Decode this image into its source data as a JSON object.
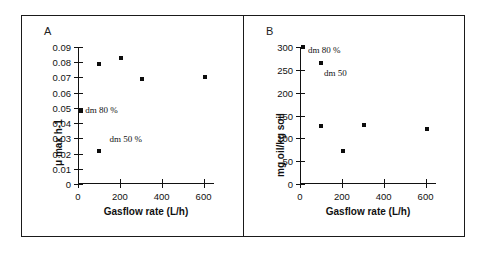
{
  "figure": {
    "panels": [
      {
        "letter": "A",
        "xlabel": "Gasflow rate (L/h)",
        "ylabel": "μ   max  h-1",
        "xticks": [
          0,
          200,
          400,
          600
        ],
        "xticklabels": [
          "0",
          "200",
          "400",
          "600"
        ],
        "yticks": [
          0,
          0.01,
          0.02,
          0.03,
          0.04,
          0.05,
          0.06,
          0.07,
          0.08,
          0.09
        ],
        "yticklabels": [
          "0",
          "0.01",
          "0.02",
          "0.03",
          "0.04",
          "0.05",
          "0.06",
          "0.07",
          "0.08",
          "0.09"
        ],
        "annotations": [
          {
            "text": "dm 80 %",
            "x": 35,
            "y": 0.0485
          },
          {
            "text": "dm 50 %",
            "x": 150,
            "y": 0.0295
          }
        ]
      },
      {
        "letter": "B",
        "xlabel": "Gasflow rate (L/h)",
        "ylabel": "mg  oil/kg  soil",
        "xticks": [
          0,
          200,
          400,
          600
        ],
        "xticklabels": [
          "0",
          "200",
          "400",
          "600"
        ],
        "yticks": [
          0,
          50,
          100,
          150,
          200,
          250,
          300
        ],
        "yticklabels": [
          "0",
          "50",
          "100",
          "150",
          "200",
          "250",
          "300"
        ],
        "annotations": [
          {
            "text": "dm 80 %",
            "x": 38,
            "y": 293
          },
          {
            "text": "dm 50",
            "x": 115,
            "y": 243
          }
        ]
      }
    ]
  },
  "chart_data": [
    {
      "type": "scatter",
      "title": "A",
      "xlabel": "Gasflow rate (L/h)",
      "ylabel": "μ max h-1",
      "xlim": [
        0,
        650
      ],
      "ylim": [
        0,
        0.09
      ],
      "xticks": [
        0,
        200,
        400,
        600
      ],
      "yticks": [
        0,
        0.01,
        0.02,
        0.03,
        0.04,
        0.05,
        0.06,
        0.07,
        0.08,
        0.09
      ],
      "grid": false,
      "legend": null,
      "series": [
        {
          "name": "dm 80 %",
          "points": [
            {
              "x": 12,
              "y": 0.048
            },
            {
              "x": 100,
              "y": 0.079
            },
            {
              "x": 205,
              "y": 0.083
            },
            {
              "x": 305,
              "y": 0.069
            },
            {
              "x": 605,
              "y": 0.07
            }
          ]
        },
        {
          "name": "dm 50 %",
          "points": [
            {
              "x": 102,
              "y": 0.022
            }
          ]
        }
      ],
      "annotations": [
        "dm 80 %",
        "dm 50 %"
      ]
    },
    {
      "type": "scatter",
      "title": "B",
      "xlabel": "Gasflow rate (L/h)",
      "ylabel": "mg oil/kg soil",
      "xlim": [
        0,
        650
      ],
      "ylim": [
        0,
        300
      ],
      "xticks": [
        0,
        200,
        400,
        600
      ],
      "yticks": [
        0,
        50,
        100,
        150,
        200,
        250,
        300
      ],
      "grid": false,
      "legend": null,
      "series": [
        {
          "name": "dm 80 %",
          "points": [
            {
              "x": 12,
              "y": 299
            },
            {
              "x": 100,
              "y": 264
            },
            {
              "x": 100,
              "y": 128
            },
            {
              "x": 205,
              "y": 73
            },
            {
              "x": 305,
              "y": 130
            },
            {
              "x": 605,
              "y": 120
            }
          ]
        }
      ],
      "annotations": [
        "dm 80 %",
        "dm 50"
      ]
    }
  ]
}
